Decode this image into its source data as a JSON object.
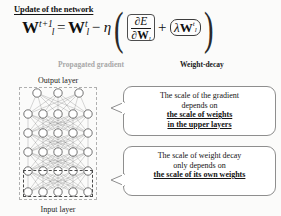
{
  "slide": {
    "title": "Update of the network",
    "background_color": "#fbfbfa"
  },
  "formula": {
    "lhs_base": "W",
    "lhs_sub": "l",
    "lhs_sup": "t+1",
    "equals": "=",
    "rhs_base": "W",
    "rhs_sub": "l",
    "rhs_sup": "t",
    "minus": "−",
    "eta": "η",
    "paren_open": "(",
    "paren_close": ")",
    "gradient_numerator_partial": "∂",
    "gradient_numerator_var": "E",
    "gradient_denominator_partial": "∂",
    "gradient_denominator_var": "W",
    "gradient_denominator_sub": "l",
    "plus": "+",
    "lambda": "λ",
    "decay_var": "W",
    "decay_sub": "l",
    "decay_sup": "t",
    "plain_text": "W_l^{t+1} = W_l^t - η ( ∂E/∂W_l + λW_l^t )"
  },
  "annotations": {
    "gradient_label": "Propagated gradient",
    "gradient_label_color": "#a8a8a8",
    "weight_decay_label": "Weight-decay",
    "weight_decay_label_color": "#1a1a1a"
  },
  "network": {
    "output_layer_label": "Output layer",
    "input_layer_label": "Input layer",
    "layer_node_counts": [
      3,
      5,
      5,
      5,
      5,
      5
    ],
    "outer_box_style": "dashed",
    "outer_box_color": "#b0b0b0",
    "inner_box_style": "dashed",
    "inner_box_color": "#4a4a4a",
    "node_fill": "#ffffff",
    "node_stroke": "#3a3a3a",
    "edge_color": "#7a7a7a"
  },
  "callouts": [
    {
      "id": "gradient-scale-callout",
      "lines": [
        {
          "text": "The scale of the gradient",
          "emphasis": false
        },
        {
          "text": "depends on",
          "emphasis": false
        },
        {
          "text": "the scale of weights",
          "emphasis": true
        },
        {
          "text": "in the upper layers",
          "emphasis": true
        }
      ]
    },
    {
      "id": "weight-decay-scale-callout",
      "lines": [
        {
          "text": "The scale of weight decay",
          "emphasis": false
        },
        {
          "text": "only depends on",
          "emphasis": false
        },
        {
          "text": "the scale of its own weights",
          "emphasis": true
        }
      ]
    }
  ]
}
